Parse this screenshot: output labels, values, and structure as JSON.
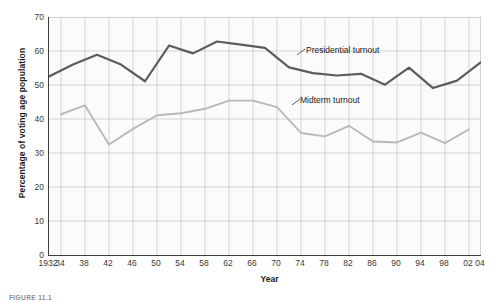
{
  "figure": {
    "caption": "FIGURE 11.1"
  },
  "annotations": {
    "presidential": "Presidential turnout",
    "midterm": "Midterm turnout"
  },
  "colors": {
    "presidential_line": "#5c5c5c",
    "midterm_line": "#b9b9b9",
    "grid": "#c9c9c9",
    "axis": "#3d3d3d",
    "plot_background": "#fbfbfb",
    "text": "#1a1a1a"
  },
  "chart_data": {
    "type": "line",
    "title": "",
    "subtitle": "",
    "xlabel": "Year",
    "ylabel": "Percentage of voting age population",
    "xlim": [
      1932,
      2004
    ],
    "ylim": [
      0,
      70
    ],
    "ytick_labels": [
      "0",
      "10",
      "20",
      "30",
      "40",
      "50",
      "60",
      "70"
    ],
    "ytick_values": [
      0,
      10,
      20,
      30,
      40,
      50,
      60,
      70
    ],
    "xtick_labels": [
      "1932",
      "34",
      "38",
      "42",
      "46",
      "50",
      "54",
      "58",
      "62",
      "66",
      "70",
      "74",
      "78",
      "82",
      "86",
      "90",
      "94",
      "98",
      "02",
      "04"
    ],
    "xtick_values": [
      1932,
      1934,
      1938,
      1942,
      1946,
      1950,
      1954,
      1958,
      1962,
      1966,
      1970,
      1974,
      1978,
      1982,
      1986,
      1990,
      1994,
      1998,
      2002,
      2004
    ],
    "grid": true,
    "legend_position": "inline-annotation",
    "series": [
      {
        "name": "Presidential turnout",
        "color": "#5c5c5c",
        "x": [
          1932,
          1936,
          1940,
          1944,
          1948,
          1952,
          1956,
          1960,
          1964,
          1968,
          1972,
          1976,
          1980,
          1984,
          1988,
          1992,
          1996,
          2000,
          2004
        ],
        "values": [
          52.5,
          56.0,
          58.9,
          56.0,
          51.1,
          61.6,
          59.3,
          62.8,
          61.9,
          60.9,
          55.2,
          53.5,
          52.8,
          53.3,
          50.1,
          55.1,
          49.1,
          51.3,
          56.7
        ]
      },
      {
        "name": "Midterm turnout",
        "color": "#b9b9b9",
        "x": [
          1934,
          1938,
          1942,
          1946,
          1950,
          1954,
          1958,
          1962,
          1966,
          1970,
          1974,
          1978,
          1982,
          1986,
          1990,
          1994,
          1998,
          2002
        ],
        "values": [
          41.4,
          44.0,
          32.5,
          37.1,
          41.1,
          41.7,
          43.0,
          45.4,
          45.4,
          43.5,
          35.9,
          34.9,
          38.0,
          33.4,
          33.1,
          36.0,
          32.9,
          37.0
        ]
      }
    ]
  }
}
